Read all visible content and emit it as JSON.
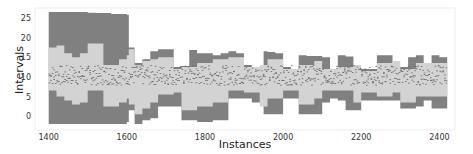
{
  "chart_data": {
    "type": "area",
    "title": "",
    "xlabel": "Instances",
    "ylabel": "Intervals",
    "xlim": [
      1365,
      2440
    ],
    "ylim": [
      -3.5,
      27.5
    ],
    "xticks": [
      1400,
      1600,
      1800,
      2000,
      2200,
      2400
    ],
    "yticks": [
      0,
      5,
      10,
      15,
      20,
      25
    ],
    "grid": false,
    "legend": null,
    "colors": {
      "outer_band": "#808080",
      "inner_band": "#d3d3d3",
      "background": "#ffffff",
      "axes_frame": "#eeeeee"
    },
    "series": [
      {
        "name": "outer interval",
        "x": [
          1400,
          1440,
          1480,
          1500,
          1520,
          1560,
          1600,
          1605,
          1620,
          1640,
          1660,
          1680,
          1720,
          1740,
          1760,
          1780,
          1820,
          1840,
          1860,
          1880,
          1900,
          1920,
          1950,
          1960,
          1980,
          2000,
          2020,
          2040,
          2060,
          2100,
          2120,
          2140,
          2160,
          2180,
          2200,
          2240,
          2260,
          2280,
          2300,
          2320,
          2340,
          2360,
          2380,
          2400,
          2420
        ],
        "upper": [
          26.5,
          26.5,
          26.5,
          26.3,
          26.2,
          26.0,
          25.8,
          17.5,
          13.5,
          14.5,
          16.5,
          17.0,
          12.5,
          12.8,
          16.8,
          16.0,
          15.5,
          16.0,
          16.5,
          16.0,
          13.0,
          12.5,
          16.5,
          16.3,
          16.0,
          12.5,
          12.0,
          15.5,
          15.3,
          15.0,
          11.5,
          15.5,
          15.2,
          12.0,
          12.0,
          15.5,
          15.5,
          12.5,
          12.5,
          15.0,
          15.5,
          12.5,
          15.5,
          15.0,
          14.0
        ],
        "lower": [
          -2.0,
          -2.0,
          -2.0,
          -2.0,
          -2.0,
          -2.0,
          -1.5,
          1.5,
          -2.0,
          -1.0,
          -0.5,
          2.5,
          2.5,
          -1.0,
          -1.0,
          -1.5,
          -1.0,
          -1.0,
          4.5,
          4.5,
          4.5,
          3.5,
          0.5,
          0.5,
          0.5,
          4.5,
          4.5,
          0.5,
          0.5,
          3.5,
          4.5,
          4.0,
          1.5,
          1.5,
          4.0,
          4.0,
          4.0,
          4.0,
          2.0,
          2.0,
          2.5,
          4.0,
          2.0,
          2.0,
          4.0
        ]
      },
      {
        "name": "inner interval",
        "x": [
          1400,
          1420,
          1440,
          1460,
          1480,
          1500,
          1540,
          1580,
          1600,
          1605,
          1620,
          1640,
          1660,
          1680,
          1720,
          1740,
          1780,
          1820,
          1860,
          1900,
          1940,
          1960,
          2000,
          2040,
          2080,
          2100,
          2140,
          2180,
          2200,
          2240,
          2280,
          2300,
          2340,
          2380,
          2420
        ],
        "upper": [
          17.5,
          18.0,
          16.0,
          15.0,
          16.0,
          18.5,
          13.0,
          14.5,
          15.5,
          17.0,
          13.0,
          14.0,
          14.5,
          15.0,
          12.0,
          12.5,
          13.5,
          14.5,
          15.0,
          12.5,
          13.0,
          14.5,
          12.0,
          13.0,
          14.0,
          12.0,
          12.5,
          13.0,
          11.5,
          13.5,
          14.0,
          12.0,
          13.5,
          13.5,
          13.0
        ],
        "lower": [
          6.5,
          5.0,
          4.0,
          3.0,
          3.5,
          6.5,
          2.5,
          3.5,
          4.5,
          3.0,
          0.5,
          2.0,
          3.5,
          5.5,
          6.0,
          1.5,
          2.5,
          3.5,
          6.5,
          6.0,
          2.5,
          4.5,
          6.5,
          3.0,
          4.5,
          6.5,
          6.5,
          3.5,
          6.0,
          5.0,
          6.0,
          3.5,
          5.0,
          5.0,
          6.0
        ]
      },
      {
        "name": "center points",
        "note_visual": "dense dotted dark marks around the median",
        "y_center_approx": 10.5
      }
    ]
  }
}
